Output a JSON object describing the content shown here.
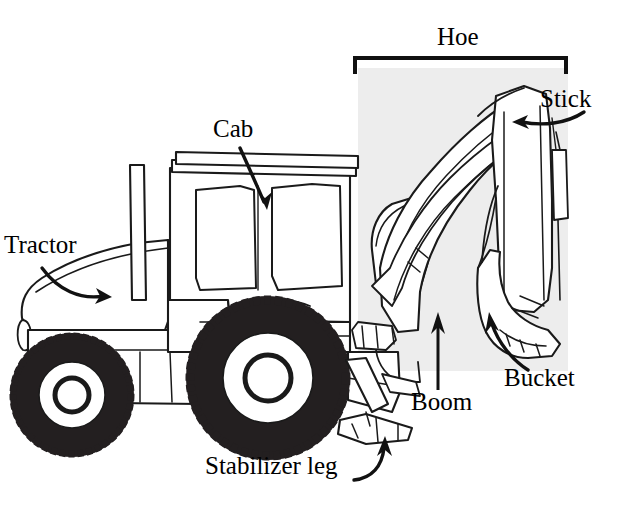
{
  "figure": {
    "background_color": "#ffffff",
    "line_color": "#1a1a1a",
    "highlight_color": "#ededed",
    "highlight_region_label": "hoe-assembly-highlight"
  },
  "labels": {
    "tractor": "Tractor",
    "cab": "Cab",
    "hoe": "Hoe",
    "stick": "Stick",
    "boom": "Boom",
    "bucket": "Bucket",
    "stabilizer_leg": "Stabilizer leg"
  },
  "annotations": {
    "tractor_pointer": "curved-arrow-down-right",
    "cab_pointer": "curved-arrow-down",
    "stick_pointer": "curved-arrow-left",
    "boom_pointer": "straight-arrow-up",
    "bucket_pointer": "curved-arrow-up-left",
    "stabilizer_pointer": "curved-arrow-up-right",
    "hoe_pointer": "square-bracket-span"
  },
  "parts": {
    "front_wheel": "front-tire",
    "rear_wheel": "rear-tire",
    "exhaust_stack": "exhaust-pipe",
    "cab_roof": "cab-roof",
    "cab_window_front": "cab-window-front",
    "cab_window_rear": "cab-window-rear",
    "hood": "engine-hood",
    "boom_arm": "boom-arm",
    "stick_arm": "stick-arm",
    "bucket_body": "bucket",
    "stabilizer_pad": "stabilizer-foot",
    "hydraulic_cylinder": "hydraulic-cylinder"
  }
}
